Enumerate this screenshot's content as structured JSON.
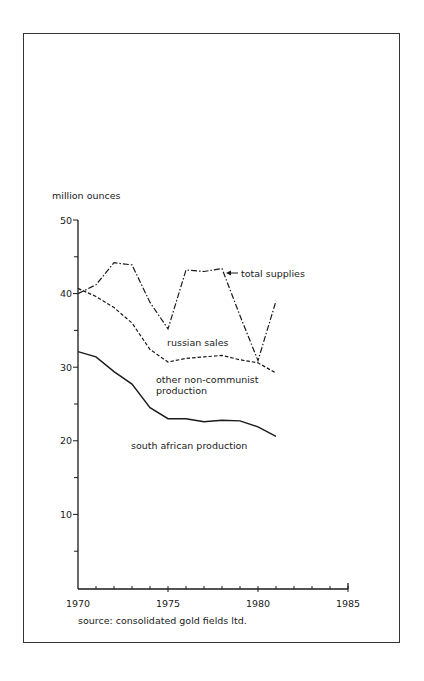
{
  "chart_data": {
    "type": "line",
    "title": "",
    "ylabel": "million ounces",
    "xlabel": "",
    "source": "source: consolidated gold fields ltd.",
    "x": [
      1970,
      1971,
      1972,
      1973,
      1974,
      1975,
      1976,
      1977,
      1978,
      1979,
      1980,
      1981
    ],
    "xlim": [
      1970,
      1985
    ],
    "ylim": [
      0,
      50
    ],
    "x_ticks": [
      "1970",
      "1975",
      "1980",
      "1985"
    ],
    "y_ticks": [
      "10",
      "20",
      "30",
      "40",
      "50"
    ],
    "grid": false,
    "legend": "inline annotations",
    "series": [
      {
        "name": "total supplies",
        "style": "dash-dot",
        "values": [
          40.0,
          41.2,
          44.2,
          43.9,
          38.8,
          35.2,
          43.2,
          43.0,
          43.4,
          37.0,
          30.9,
          39.0
        ]
      },
      {
        "name": "other non-communist production (cumulative with south african production)",
        "style": "dashed",
        "values": [
          40.7,
          39.6,
          38.1,
          36.0,
          32.4,
          30.7,
          31.2,
          31.4,
          31.6,
          31.0,
          30.6,
          29.2
        ]
      },
      {
        "name": "south african production",
        "style": "solid",
        "values": [
          32.1,
          31.4,
          29.4,
          27.7,
          24.5,
          23.0,
          23.0,
          22.6,
          22.8,
          22.7,
          21.9,
          20.6
        ]
      }
    ],
    "annotations": {
      "total_supplies": "total supplies",
      "russian_sales": "russian sales",
      "other_line1": "other non-communist",
      "other_line2": "production",
      "south_african": "south african production"
    }
  }
}
